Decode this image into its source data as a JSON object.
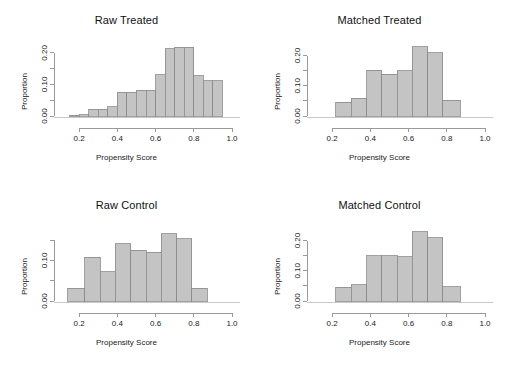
{
  "figure": {
    "background": "#ffffff",
    "bar_fill": "#c4c4c4",
    "bar_stroke": "#8a8a8a",
    "axis_color": "#9a9a9a",
    "text_color": "#222222"
  },
  "panels": [
    {
      "id": "raw-treated",
      "title": "Raw Treated",
      "xlabel": "Propensity Score",
      "ylabel": "Proportion"
    },
    {
      "id": "matched-treated",
      "title": "Matched Treated",
      "xlabel": "Propensity Score",
      "ylabel": "Proportion"
    },
    {
      "id": "raw-control",
      "title": "Raw Control",
      "xlabel": "Propensity Score",
      "ylabel": "Proportion"
    },
    {
      "id": "matched-control",
      "title": "Matched Control",
      "xlabel": "Propensity Score",
      "ylabel": "Proportion"
    }
  ],
  "chart_data": [
    {
      "type": "bar",
      "id": "raw-treated",
      "title": "Raw Treated",
      "xlabel": "Propensity Score",
      "ylabel": "Proportion",
      "xlim": [
        0.1,
        1.0
      ],
      "ylim": [
        0.0,
        0.225
      ],
      "xticks": [
        0.2,
        0.4,
        0.6,
        0.8,
        1.0
      ],
      "xticklabels": [
        "0.2",
        "0.4",
        "0.6",
        "0.8",
        "1.0"
      ],
      "yticks": [
        0.0,
        0.05,
        0.1,
        0.15,
        0.2
      ],
      "yticklabels": [
        "0.00",
        "",
        "0.10",
        "",
        "0.20"
      ],
      "grid": false,
      "legend": null,
      "bin_edges": [
        0.15,
        0.2,
        0.25,
        0.3,
        0.35,
        0.4,
        0.45,
        0.5,
        0.55,
        0.6,
        0.65,
        0.7,
        0.75,
        0.8,
        0.85,
        0.9,
        0.95
      ],
      "bins": [
        {
          "x0": 0.15,
          "x1": 0.2,
          "value": 0.002
        },
        {
          "x0": 0.2,
          "x1": 0.25,
          "value": 0.004
        },
        {
          "x0": 0.25,
          "x1": 0.3,
          "value": 0.022
        },
        {
          "x0": 0.3,
          "x1": 0.35,
          "value": 0.022
        },
        {
          "x0": 0.35,
          "x1": 0.4,
          "value": 0.03
        },
        {
          "x0": 0.4,
          "x1": 0.45,
          "value": 0.075
        },
        {
          "x0": 0.45,
          "x1": 0.5,
          "value": 0.075
        },
        {
          "x0": 0.5,
          "x1": 0.55,
          "value": 0.082
        },
        {
          "x0": 0.55,
          "x1": 0.6,
          "value": 0.082
        },
        {
          "x0": 0.6,
          "x1": 0.65,
          "value": 0.13
        },
        {
          "x0": 0.65,
          "x1": 0.7,
          "value": 0.213
        },
        {
          "x0": 0.7,
          "x1": 0.75,
          "value": 0.218
        },
        {
          "x0": 0.75,
          "x1": 0.8,
          "value": 0.218
        },
        {
          "x0": 0.8,
          "x1": 0.85,
          "value": 0.128
        },
        {
          "x0": 0.85,
          "x1": 0.9,
          "value": 0.112
        },
        {
          "x0": 0.9,
          "x1": 0.95,
          "value": 0.112
        }
      ]
    },
    {
      "type": "bar",
      "id": "matched-treated",
      "title": "Matched Treated",
      "xlabel": "Propensity Score",
      "ylabel": "Proportion",
      "xlim": [
        0.1,
        1.0
      ],
      "ylim": [
        0.0,
        0.235
      ],
      "xticks": [
        0.2,
        0.4,
        0.6,
        0.8,
        1.0
      ],
      "xticklabels": [
        "0.2",
        "0.4",
        "0.6",
        "0.8",
        "1.0"
      ],
      "yticks": [
        0.0,
        0.05,
        0.1,
        0.15,
        0.2
      ],
      "yticklabels": [
        "0.00",
        "",
        "0.10",
        "",
        "0.20"
      ],
      "grid": false,
      "legend": null,
      "bin_edges": [
        0.22,
        0.3,
        0.38,
        0.46,
        0.54,
        0.62,
        0.7,
        0.78,
        0.87
      ],
      "bins": [
        {
          "x0": 0.22,
          "x1": 0.3,
          "value": 0.046
        },
        {
          "x0": 0.3,
          "x1": 0.38,
          "value": 0.058
        },
        {
          "x0": 0.38,
          "x1": 0.46,
          "value": 0.152
        },
        {
          "x0": 0.46,
          "x1": 0.54,
          "value": 0.138
        },
        {
          "x0": 0.54,
          "x1": 0.62,
          "value": 0.15
        },
        {
          "x0": 0.62,
          "x1": 0.7,
          "value": 0.229
        },
        {
          "x0": 0.7,
          "x1": 0.78,
          "value": 0.21
        },
        {
          "x0": 0.78,
          "x1": 0.87,
          "value": 0.052
        }
      ]
    },
    {
      "type": "bar",
      "id": "raw-control",
      "title": "Raw Control",
      "xlabel": "Propensity Score",
      "ylabel": "Proportion",
      "xlim": [
        0.1,
        1.0
      ],
      "ylim": [
        0.0,
        0.175
      ],
      "xticks": [
        0.2,
        0.4,
        0.6,
        0.8,
        1.0
      ],
      "xticklabels": [
        "0.2",
        "0.4",
        "0.6",
        "0.8",
        "1.0"
      ],
      "yticks": [
        0.0,
        0.05,
        0.1,
        0.15
      ],
      "yticklabels": [
        "0.00",
        "",
        "0.10",
        ""
      ],
      "grid": false,
      "legend": null,
      "bin_edges": [
        0.14,
        0.23,
        0.31,
        0.39,
        0.47,
        0.55,
        0.63,
        0.71,
        0.79,
        0.87
      ],
      "bins": [
        {
          "x0": 0.14,
          "x1": 0.23,
          "value": 0.032
        },
        {
          "x0": 0.23,
          "x1": 0.31,
          "value": 0.108
        },
        {
          "x0": 0.31,
          "x1": 0.39,
          "value": 0.072
        },
        {
          "x0": 0.39,
          "x1": 0.47,
          "value": 0.141
        },
        {
          "x0": 0.47,
          "x1": 0.55,
          "value": 0.125
        },
        {
          "x0": 0.55,
          "x1": 0.63,
          "value": 0.12
        },
        {
          "x0": 0.63,
          "x1": 0.71,
          "value": 0.166
        },
        {
          "x0": 0.71,
          "x1": 0.79,
          "value": 0.154
        },
        {
          "x0": 0.79,
          "x1": 0.87,
          "value": 0.032
        }
      ]
    },
    {
      "type": "bar",
      "id": "matched-control",
      "title": "Matched Control",
      "xlabel": "Propensity Score",
      "ylabel": "Proportion",
      "xlim": [
        0.1,
        1.0
      ],
      "ylim": [
        0.0,
        0.235
      ],
      "xticks": [
        0.2,
        0.4,
        0.6,
        0.8,
        1.0
      ],
      "xticklabels": [
        "0.2",
        "0.4",
        "0.6",
        "0.8",
        "1.0"
      ],
      "yticks": [
        0.0,
        0.05,
        0.1,
        0.15,
        0.2
      ],
      "yticklabels": [
        "0.00",
        "",
        "0.10",
        "",
        "0.20"
      ],
      "grid": false,
      "legend": null,
      "bin_edges": [
        0.22,
        0.3,
        0.38,
        0.46,
        0.54,
        0.62,
        0.7,
        0.78,
        0.87
      ],
      "bins": [
        {
          "x0": 0.22,
          "x1": 0.3,
          "value": 0.046
        },
        {
          "x0": 0.3,
          "x1": 0.38,
          "value": 0.053
        },
        {
          "x0": 0.38,
          "x1": 0.46,
          "value": 0.15
        },
        {
          "x0": 0.46,
          "x1": 0.54,
          "value": 0.15
        },
        {
          "x0": 0.54,
          "x1": 0.62,
          "value": 0.146
        },
        {
          "x0": 0.62,
          "x1": 0.7,
          "value": 0.229
        },
        {
          "x0": 0.7,
          "x1": 0.78,
          "value": 0.21
        },
        {
          "x0": 0.78,
          "x1": 0.87,
          "value": 0.048
        }
      ]
    }
  ]
}
